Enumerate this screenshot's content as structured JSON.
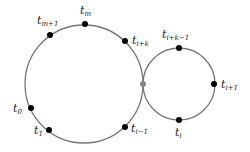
{
  "diagram": {
    "big_circle": {
      "cx": 84,
      "cy": 84,
      "r": 59,
      "stroke": "#777777"
    },
    "small_circle": {
      "cx": 179,
      "cy": 84,
      "r": 36,
      "stroke": "#777777"
    },
    "touch_point": {
      "x": 143,
      "y": 84,
      "fill": "#888888"
    },
    "points": [
      {
        "id": "tm",
        "x": 85,
        "y": 24,
        "base": "t",
        "sub": "m",
        "lx": 80,
        "ly": 14
      },
      {
        "id": "tm1",
        "x": 50,
        "y": 35,
        "base": "t",
        "sub": "m+1",
        "lx": 37,
        "ly": 24
      },
      {
        "id": "tik",
        "x": 125,
        "y": 41,
        "base": "t",
        "sub": "i+k",
        "lx": 132,
        "ly": 44
      },
      {
        "id": "t0",
        "x": 31,
        "y": 108,
        "base": "t",
        "sub": "0",
        "lx": 13,
        "ly": 112
      },
      {
        "id": "t1",
        "x": 49,
        "y": 130,
        "base": "t",
        "sub": "1",
        "lx": 34,
        "ly": 134
      },
      {
        "id": "tim1",
        "x": 125,
        "y": 127,
        "base": "t",
        "sub": "i−1",
        "lx": 131,
        "ly": 132
      },
      {
        "id": "tik1",
        "x": 179,
        "y": 48,
        "base": "t",
        "sub": "i+k−1",
        "lx": 162,
        "ly": 38
      },
      {
        "id": "ti1",
        "x": 214,
        "y": 84,
        "base": "t",
        "sub": "i+1",
        "lx": 221,
        "ly": 88
      },
      {
        "id": "ti",
        "x": 179,
        "y": 120,
        "base": "t",
        "sub": "i",
        "lx": 175,
        "ly": 136
      }
    ]
  }
}
